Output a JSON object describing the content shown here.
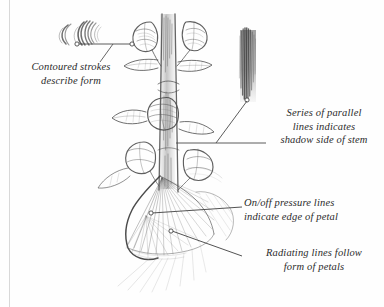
{
  "figure": {
    "type": "pencil-drawing-annotated-diagram",
    "background_color": "#fefefe",
    "ink_color": "#2b2b2b",
    "pencil_color": "#6b6b6b"
  },
  "callouts": [
    {
      "id": "contoured-strokes",
      "lines": [
        "Contoured strokes",
        "describe form"
      ],
      "line1": "Contoured strokes",
      "line2": "describe form",
      "points_to": "curved-hatching-sample"
    },
    {
      "id": "parallel-lines",
      "lines": [
        "Series of parallel",
        "lines indicates",
        "shadow side of stem"
      ],
      "line1": "Series of parallel",
      "line2": "lines indicates",
      "line3": "shadow side of stem",
      "points_to": "vertical-hatching-swatch"
    },
    {
      "id": "pressure-lines",
      "lines": [
        "On/off pressure lines",
        "indicate edge of petal"
      ],
      "line1": "On/off pressure lines",
      "line2": "indicate edge of petal",
      "points_to": "petal-edge"
    },
    {
      "id": "radiating-lines",
      "lines": [
        "Radiating lines follow",
        "form of petals"
      ],
      "line1": "Radiating lines follow",
      "line2": "form of petals",
      "points_to": "petal-fan"
    }
  ],
  "samples": [
    {
      "id": "curved-hatching-sample",
      "label": "curved contour stroke swatch"
    },
    {
      "id": "vertical-hatching-swatch",
      "label": "parallel vertical hatching swatch"
    }
  ]
}
